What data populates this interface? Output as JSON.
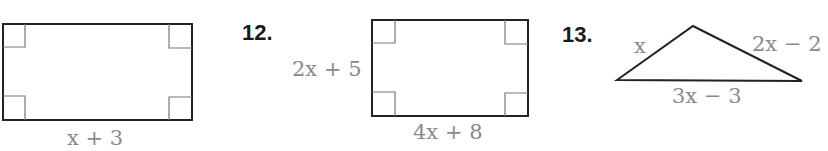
{
  "problems": [
    {
      "number": "",
      "shape": "rectangle",
      "labels": {
        "bottom": "x + 3"
      }
    },
    {
      "number": "12.",
      "shape": "rectangle",
      "labels": {
        "left": "2x + 5",
        "bottom": "4x + 8"
      }
    },
    {
      "number": "13.",
      "shape": "triangle",
      "labels": {
        "left": "x",
        "right": "2x − 2",
        "bottom": "3x − 3"
      }
    }
  ],
  "colors": {
    "stroke": "#222222",
    "label": "#8a8a8a",
    "right_angle_mark": "#777777"
  }
}
